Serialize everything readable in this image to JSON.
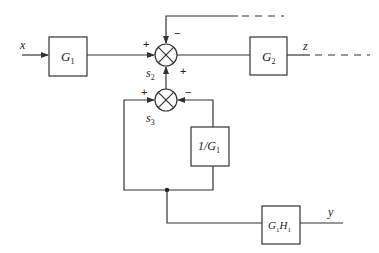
{
  "diagram": {
    "type": "block-diagram",
    "input": {
      "label": "x"
    },
    "outputs": [
      {
        "label": "z"
      },
      {
        "label": "y"
      }
    ],
    "blocks": [
      {
        "id": "G1",
        "label_main": "G",
        "label_sub": "1"
      },
      {
        "id": "G2",
        "label_main": "G",
        "label_sub": "2"
      },
      {
        "id": "invG1",
        "label_prefix": "1/G",
        "label_sub": "1"
      },
      {
        "id": "G1H1",
        "label_main": "G",
        "label_sub": "1",
        "label_main2": "H",
        "label_sub2": "1"
      }
    ],
    "summing_junctions": [
      {
        "id": "s2",
        "label_main": "s",
        "label_sub": "2",
        "signs": {
          "left": "+",
          "top": "−",
          "bottom": "+"
        }
      },
      {
        "id": "s3",
        "label_main": "s",
        "label_sub": "3",
        "signs": {
          "left": "+",
          "right": "−"
        }
      }
    ]
  }
}
